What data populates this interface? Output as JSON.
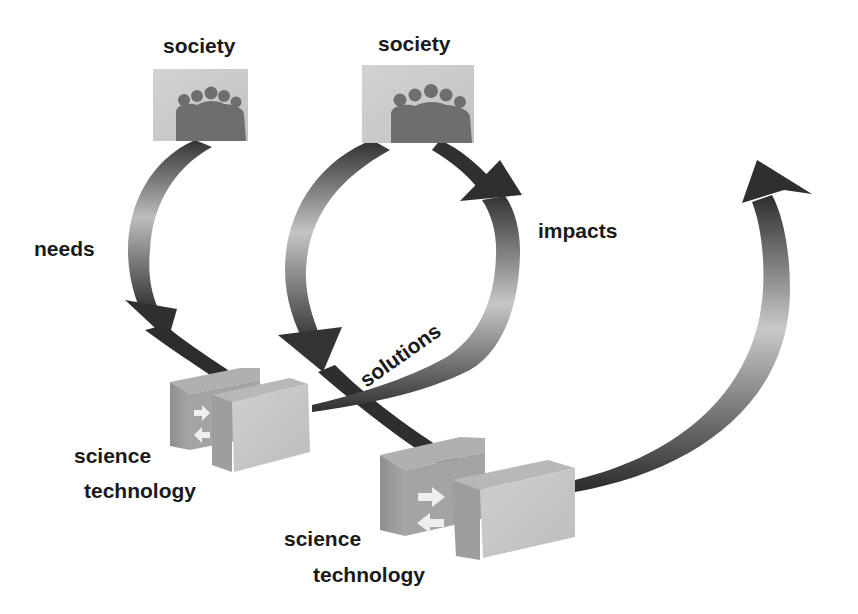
{
  "diagram": {
    "type": "cyclic-flow",
    "colors": {
      "arrow_dark": "#3a3a3a",
      "arrow_light": "#c8c8c8",
      "box_light": "#c9c9c9",
      "box_mid": "#9a9a9a",
      "people": "#6b6b6b",
      "text": "#1a1a1a"
    },
    "nodes": [
      {
        "id": "society-1",
        "label": "society",
        "icon": "people-group-icon"
      },
      {
        "id": "society-2",
        "label": "society",
        "icon": "people-group-icon"
      },
      {
        "id": "sci-tech-1",
        "label_top": "science",
        "label_bottom": "technology",
        "icon": "exchange-arrows-icon"
      },
      {
        "id": "sci-tech-2",
        "label_top": "science",
        "label_bottom": "technology",
        "icon": "exchange-arrows-icon"
      }
    ],
    "edges": [
      {
        "from": "society-1",
        "to": "sci-tech-1",
        "label": "needs"
      },
      {
        "from": "society-2",
        "to": "sci-tech-2",
        "label": ""
      },
      {
        "from": "sci-tech-1",
        "to": "society-2",
        "label": "impacts"
      },
      {
        "from": "sci-tech-1",
        "to": "sci-tech-2",
        "label": "solutions"
      },
      {
        "from": "sci-tech-2",
        "to": "next",
        "label": ""
      }
    ]
  },
  "labels": {
    "society_1": "society",
    "society_2": "society",
    "needs": "needs",
    "impacts": "impacts",
    "solutions": "solutions",
    "science_1": "science",
    "technology_1": "technology",
    "science_2": "science",
    "technology_2": "technology"
  }
}
